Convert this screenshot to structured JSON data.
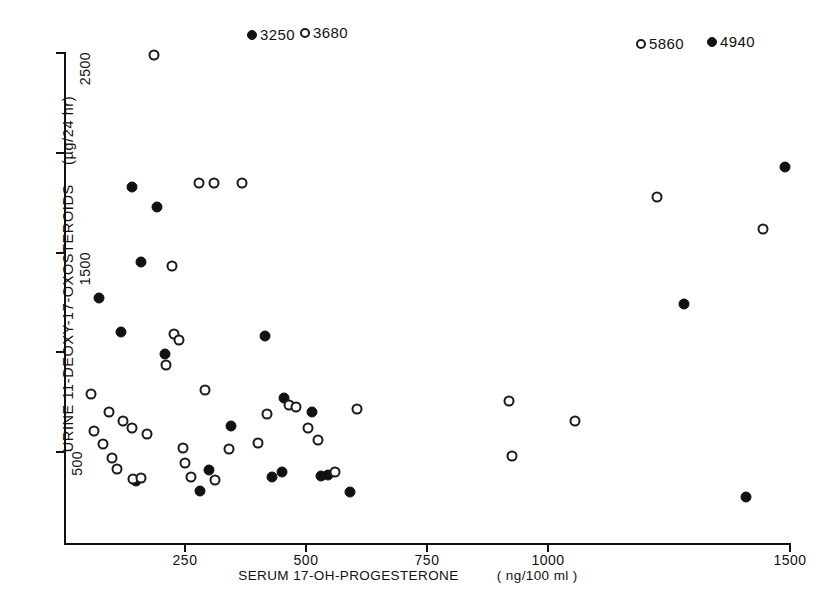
{
  "chart_data": {
    "type": "scatter",
    "title": "",
    "xlabel": "SERUM 17-OH-PROGESTERONE",
    "xunit": "( ng/100 ml )",
    "ylabel": "URINE  11-DEOXY-17-OXOSTEROIDS",
    "yunit": "(µg/24 hr)",
    "xlim": [
      0,
      1500
    ],
    "ylim": [
      0,
      2600
    ],
    "grid": false,
    "legend": null,
    "xticks": [
      250,
      500,
      750,
      1000,
      1500
    ],
    "xtick_labels": [
      "250",
      "500",
      "750",
      "1000",
      "1500"
    ],
    "yticks": [
      500,
      1000,
      1500,
      2000,
      2500
    ],
    "ytick_labels": [
      "500",
      "",
      "1500",
      "",
      "2500"
    ],
    "series": [
      {
        "name": "filled-circle",
        "marker": "filled",
        "points": [
          [
            72,
            1270
          ],
          [
            118,
            1100
          ],
          [
            140,
            1830
          ],
          [
            160,
            1450
          ],
          [
            148,
            355
          ],
          [
            193,
            1730
          ],
          [
            208,
            990
          ],
          [
            282,
            305
          ],
          [
            300,
            410
          ],
          [
            345,
            630
          ],
          [
            415,
            1080
          ],
          [
            430,
            375
          ],
          [
            450,
            400
          ],
          [
            455,
            770
          ],
          [
            512,
            700
          ],
          [
            530,
            380
          ],
          [
            545,
            385
          ],
          [
            590,
            300
          ],
          [
            1280,
            1240
          ],
          [
            1410,
            275
          ],
          [
            1490,
            1930
          ]
        ]
      },
      {
        "name": "open-circle",
        "marker": "open",
        "points": [
          [
            56,
            790
          ],
          [
            62,
            605
          ],
          [
            80,
            540
          ],
          [
            92,
            700
          ],
          [
            100,
            470
          ],
          [
            110,
            415
          ],
          [
            122,
            655
          ],
          [
            140,
            620
          ],
          [
            142,
            365
          ],
          [
            160,
            370
          ],
          [
            172,
            590
          ],
          [
            185,
            2490
          ],
          [
            210,
            935
          ],
          [
            223,
            1430
          ],
          [
            228,
            1090
          ],
          [
            238,
            1060
          ],
          [
            245,
            520
          ],
          [
            250,
            445
          ],
          [
            262,
            375
          ],
          [
            279,
            1850
          ],
          [
            292,
            810
          ],
          [
            310,
            1850
          ],
          [
            312,
            360
          ],
          [
            340,
            515
          ],
          [
            368,
            1850
          ],
          [
            400,
            545
          ],
          [
            420,
            690
          ],
          [
            465,
            735
          ],
          [
            480,
            725
          ],
          [
            505,
            620
          ],
          [
            525,
            560
          ],
          [
            560,
            400
          ],
          [
            605,
            715
          ],
          [
            920,
            755
          ],
          [
            925,
            480
          ],
          [
            1055,
            655
          ],
          [
            1225,
            1780
          ],
          [
            1445,
            1620
          ]
        ]
      }
    ],
    "offscale_annotations": [
      {
        "marker": "filled",
        "value": "3250",
        "px": 247,
        "py": 26
      },
      {
        "marker": "open",
        "value": "3680",
        "px": 300,
        "py": 24
      },
      {
        "marker": "open",
        "value": "5860",
        "px": 636,
        "py": 35
      },
      {
        "marker": "filled",
        "value": "4940",
        "px": 707,
        "py": 33
      }
    ],
    "colors": {
      "ink": "#111111",
      "background": "#ffffff"
    }
  }
}
